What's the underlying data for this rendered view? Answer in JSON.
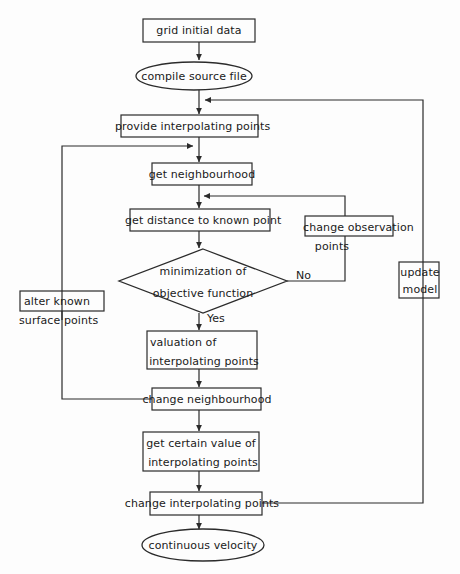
{
  "diagram": {
    "type": "flowchart",
    "stroke_color": "#2b2b2b",
    "background_color": "#fdfdfd",
    "nodes": [
      {
        "id": "grid_initial_data",
        "shape": "rect",
        "label": "grid initial data"
      },
      {
        "id": "compile_source_file",
        "shape": "ellipse",
        "label": "compile source file"
      },
      {
        "id": "provide_points",
        "shape": "rect",
        "label": "provide interpolating points"
      },
      {
        "id": "get_neighbourhood",
        "shape": "rect",
        "label": "get neighbourhood"
      },
      {
        "id": "get_distance",
        "shape": "rect",
        "label": "get distance to known point"
      },
      {
        "id": "minimization",
        "shape": "diamond",
        "label_line1": "minimization of",
        "label_line2": "objective function"
      },
      {
        "id": "change_observation",
        "shape": "rect",
        "label_line1": "change observation",
        "label_line2": "points"
      },
      {
        "id": "update_model",
        "shape": "rect",
        "label_line1": "update",
        "label_line2": "model"
      },
      {
        "id": "alter_known",
        "shape": "rect",
        "label_line1": "alter known",
        "label_line2": "surface points"
      },
      {
        "id": "valuation",
        "shape": "rect",
        "label_line1": "valuation of",
        "label_line2": "interpolating points"
      },
      {
        "id": "change_neighbourhood",
        "shape": "rect",
        "label": "change neighbourhood"
      },
      {
        "id": "get_certain_value",
        "shape": "rect",
        "label_line1": "get certain value of",
        "label_line2": "interpolating points"
      },
      {
        "id": "change_interpolating",
        "shape": "rect",
        "label": "change interpolating points"
      },
      {
        "id": "continuous_velocity",
        "shape": "ellipse",
        "label": "continuous velocity"
      }
    ],
    "edge_labels": {
      "no": "No",
      "yes": "Yes"
    }
  }
}
